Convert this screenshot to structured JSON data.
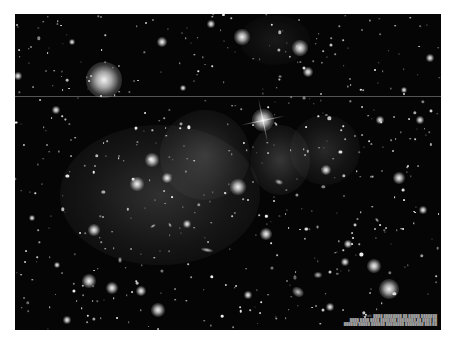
{
  "image": {
    "subject": "Galaxy cluster deep-field with diffuse intracluster light",
    "background": "#050505",
    "frame": {
      "x": 15,
      "y": 14,
      "width": 426,
      "height": 316
    }
  },
  "artifacts": {
    "horizontal_line_y": 96
  },
  "glows": [
    {
      "x": 160,
      "y": 195,
      "w": 200,
      "h": 140,
      "opacity": 0.22
    },
    {
      "x": 205,
      "y": 155,
      "w": 90,
      "h": 90,
      "opacity": 0.22
    },
    {
      "x": 280,
      "y": 160,
      "w": 60,
      "h": 70,
      "opacity": 0.25
    },
    {
      "x": 325,
      "y": 150,
      "w": 70,
      "h": 70,
      "opacity": 0.18
    },
    {
      "x": 275,
      "y": 40,
      "w": 70,
      "h": 50,
      "opacity": 0.1
    }
  ],
  "bright_stars": [
    {
      "x": 104,
      "y": 80,
      "r": 36
    },
    {
      "x": 263,
      "y": 120,
      "r": 22
    },
    {
      "x": 242,
      "y": 37,
      "r": 16
    },
    {
      "x": 300,
      "y": 48,
      "r": 16
    },
    {
      "x": 389,
      "y": 289,
      "r": 20
    },
    {
      "x": 374,
      "y": 266,
      "r": 14
    },
    {
      "x": 238,
      "y": 187,
      "r": 16
    },
    {
      "x": 152,
      "y": 160,
      "r": 14
    },
    {
      "x": 137,
      "y": 184,
      "r": 14
    },
    {
      "x": 167,
      "y": 178,
      "r": 10
    },
    {
      "x": 94,
      "y": 230,
      "r": 12
    },
    {
      "x": 89,
      "y": 281,
      "r": 14
    },
    {
      "x": 112,
      "y": 288,
      "r": 12
    },
    {
      "x": 158,
      "y": 310,
      "r": 14
    },
    {
      "x": 141,
      "y": 291,
      "r": 10
    },
    {
      "x": 266,
      "y": 234,
      "r": 12
    },
    {
      "x": 399,
      "y": 178,
      "r": 12
    },
    {
      "x": 326,
      "y": 170,
      "r": 10
    },
    {
      "x": 162,
      "y": 42,
      "r": 10
    },
    {
      "x": 211,
      "y": 24,
      "r": 8
    },
    {
      "x": 308,
      "y": 72,
      "r": 10
    },
    {
      "x": 18,
      "y": 76,
      "r": 8
    },
    {
      "x": 56,
      "y": 110,
      "r": 8
    },
    {
      "x": 430,
      "y": 58,
      "r": 8
    },
    {
      "x": 420,
      "y": 120,
      "r": 8
    },
    {
      "x": 348,
      "y": 244,
      "r": 8
    },
    {
      "x": 345,
      "y": 262,
      "r": 8
    },
    {
      "x": 423,
      "y": 210,
      "r": 8
    },
    {
      "x": 187,
      "y": 224,
      "r": 8
    },
    {
      "x": 248,
      "y": 295,
      "r": 8
    },
    {
      "x": 57,
      "y": 265,
      "r": 6
    },
    {
      "x": 67,
      "y": 320,
      "r": 8
    },
    {
      "x": 330,
      "y": 307,
      "r": 8
    },
    {
      "x": 380,
      "y": 120,
      "r": 8
    },
    {
      "x": 32,
      "y": 218,
      "r": 6
    },
    {
      "x": 72,
      "y": 42,
      "r": 6
    },
    {
      "x": 183,
      "y": 88,
      "r": 6
    },
    {
      "x": 404,
      "y": 90,
      "r": 6
    }
  ],
  "galaxies": [
    {
      "x": 298,
      "y": 292,
      "w": 12,
      "h": 9,
      "rot": 30
    },
    {
      "x": 318,
      "y": 275,
      "w": 8,
      "h": 6,
      "rot": 0
    },
    {
      "x": 207,
      "y": 250,
      "w": 12,
      "h": 4,
      "rot": 10
    },
    {
      "x": 153,
      "y": 226,
      "w": 6,
      "h": 3,
      "rot": -30
    },
    {
      "x": 170,
      "y": 225,
      "w": 5,
      "h": 3,
      "rot": 60
    },
    {
      "x": 120,
      "y": 260,
      "w": 4,
      "h": 6,
      "rot": 0
    },
    {
      "x": 279,
      "y": 182,
      "w": 8,
      "h": 5,
      "rot": 20
    },
    {
      "x": 377,
      "y": 220,
      "w": 5,
      "h": 3,
      "rot": 50
    }
  ],
  "spike_star": {
    "x": 263,
    "y": 120,
    "length": 44
  },
  "caption": {
    "lines": [
      "Credit: ████ ████████ ██ █████ ███████",
      "████ ████ ████ ███████ ████████ ██ ████ ██",
      "██████ █████ ██████ ████████ ████████ ███ ██"
    ],
    "color": "#9a9a9a"
  }
}
